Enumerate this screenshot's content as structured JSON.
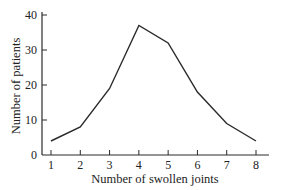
{
  "chart_data": {
    "type": "line",
    "title": "",
    "xlabel": "Number of swollen joints",
    "ylabel": "Number of patients",
    "x": [
      1,
      2,
      3,
      4,
      5,
      6,
      7,
      8
    ],
    "series": [
      {
        "name": "patients",
        "values": [
          4,
          8,
          19,
          37,
          32,
          18,
          9,
          4
        ]
      }
    ],
    "xticks": [
      1,
      2,
      3,
      4,
      5,
      6,
      7,
      8
    ],
    "yticks": [
      0,
      10,
      20,
      30,
      40
    ],
    "xlim": [
      0.7,
      8.4
    ],
    "ylim": [
      0,
      40
    ],
    "grid": false,
    "legend": null,
    "line_color": "#2a2a2a"
  }
}
